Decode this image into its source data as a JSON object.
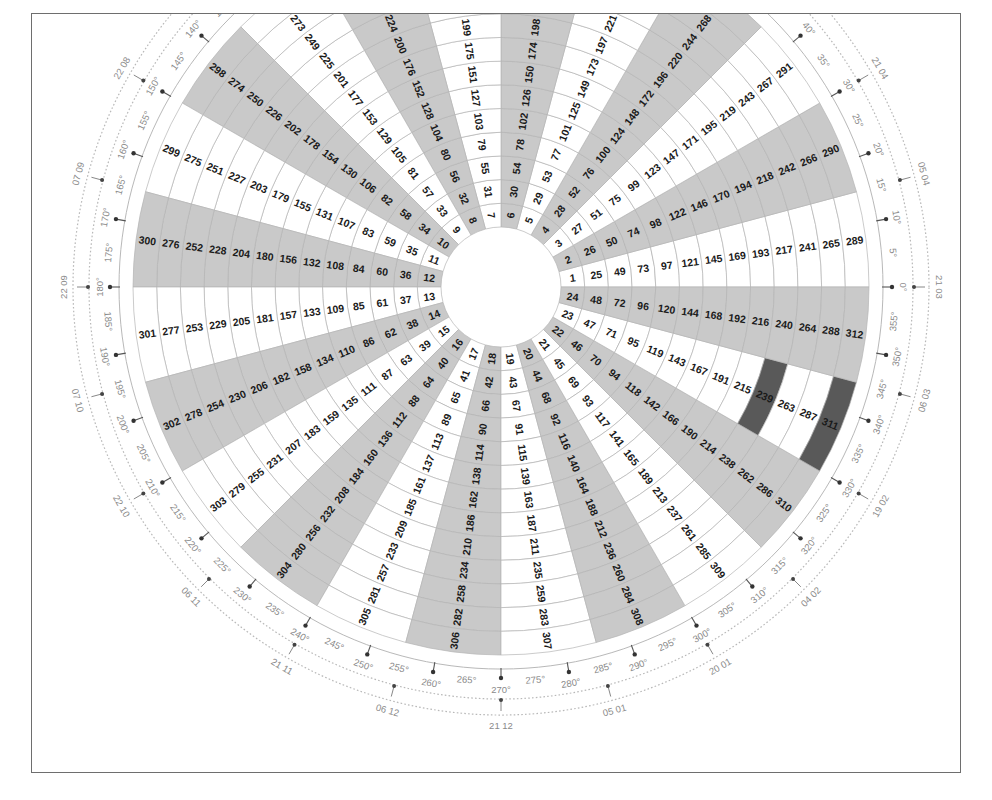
{
  "chart_data": {
    "type": "pie",
    "title": "",
    "subtitle": "",
    "xlabel": "",
    "ylabel": "",
    "sector_count": 24,
    "ring_count": 13,
    "cell_min": 1,
    "cell_max": 312,
    "cell_step_outward": 24,
    "angle_per_sector_deg": 15,
    "angle_start_deg": 0,
    "angle_direction": "counterclockwise",
    "center_px": [
      500,
      286
    ],
    "inner_radius_px": 60,
    "outer_radius_px": 368,
    "grid": true,
    "legend_position": "none",
    "colors": {
      "sector_shaded": "#c9c9c9",
      "sector_plain": "#ffffff",
      "highlight": "#595959",
      "cell_stroke": "#b4b4b4",
      "text": "#1a1a1a",
      "axis_text": "#8a8a8a",
      "axis_line": "#b0b0b0",
      "frame": "#6e6e6e"
    },
    "highlighted_cells": [
      239,
      311
    ],
    "sectors": [
      {
        "index": 0,
        "start_deg": 0,
        "end_deg": 15,
        "shaded": false,
        "base": 1,
        "values": [
          1,
          25,
          49,
          73,
          97,
          121,
          145,
          169,
          193,
          217,
          241,
          265,
          289
        ]
      },
      {
        "index": 1,
        "start_deg": 15,
        "end_deg": 30,
        "shaded": true,
        "base": 2,
        "values": [
          2,
          26,
          50,
          74,
          98,
          122,
          146,
          170,
          194,
          218,
          242,
          266,
          290
        ]
      },
      {
        "index": 2,
        "start_deg": 30,
        "end_deg": 45,
        "shaded": false,
        "base": 3,
        "values": [
          3,
          27,
          51,
          75,
          99,
          123,
          147,
          171,
          195,
          219,
          243,
          267,
          291
        ]
      },
      {
        "index": 3,
        "start_deg": 45,
        "end_deg": 60,
        "shaded": true,
        "base": 4,
        "values": [
          4,
          28,
          52,
          76,
          100,
          124,
          148,
          172,
          196,
          220,
          244,
          268,
          292
        ]
      },
      {
        "index": 4,
        "start_deg": 60,
        "end_deg": 75,
        "shaded": false,
        "base": 5,
        "values": [
          5,
          29,
          53,
          77,
          101,
          125,
          149,
          173,
          197,
          221,
          245,
          269,
          293
        ]
      },
      {
        "index": 5,
        "start_deg": 75,
        "end_deg": 90,
        "shaded": true,
        "base": 6,
        "values": [
          6,
          30,
          54,
          78,
          102,
          126,
          150,
          174,
          198,
          222,
          246,
          270,
          294
        ]
      },
      {
        "index": 6,
        "start_deg": 90,
        "end_deg": 105,
        "shaded": false,
        "base": 7,
        "values": [
          7,
          31,
          55,
          79,
          103,
          127,
          151,
          175,
          199,
          223,
          247,
          271,
          295
        ]
      },
      {
        "index": 7,
        "start_deg": 105,
        "end_deg": 120,
        "shaded": true,
        "base": 8,
        "values": [
          8,
          32,
          56,
          80,
          104,
          128,
          152,
          176,
          200,
          224,
          248,
          272,
          296
        ]
      },
      {
        "index": 8,
        "start_deg": 120,
        "end_deg": 135,
        "shaded": false,
        "base": 9,
        "values": [
          9,
          33,
          57,
          81,
          105,
          129,
          153,
          177,
          201,
          225,
          249,
          273,
          297
        ]
      },
      {
        "index": 9,
        "start_deg": 135,
        "end_deg": 150,
        "shaded": true,
        "base": 10,
        "values": [
          10,
          34,
          58,
          82,
          106,
          130,
          154,
          178,
          202,
          226,
          250,
          274,
          298
        ]
      },
      {
        "index": 10,
        "start_deg": 150,
        "end_deg": 165,
        "shaded": false,
        "base": 11,
        "values": [
          11,
          35,
          59,
          83,
          107,
          131,
          155,
          179,
          203,
          227,
          251,
          275,
          299
        ]
      },
      {
        "index": 11,
        "start_deg": 165,
        "end_deg": 180,
        "shaded": true,
        "base": 12,
        "values": [
          12,
          36,
          60,
          84,
          108,
          132,
          156,
          180,
          204,
          228,
          252,
          276,
          300
        ]
      },
      {
        "index": 12,
        "start_deg": 180,
        "end_deg": 195,
        "shaded": false,
        "base": 13,
        "values": [
          13,
          37,
          61,
          85,
          109,
          133,
          157,
          181,
          205,
          229,
          253,
          277,
          301
        ]
      },
      {
        "index": 13,
        "start_deg": 195,
        "end_deg": 210,
        "shaded": true,
        "base": 14,
        "values": [
          14,
          38,
          62,
          86,
          110,
          134,
          158,
          182,
          206,
          230,
          254,
          278,
          302
        ]
      },
      {
        "index": 14,
        "start_deg": 210,
        "end_deg": 225,
        "shaded": false,
        "base": 15,
        "values": [
          15,
          39,
          63,
          87,
          111,
          135,
          159,
          183,
          207,
          231,
          255,
          279,
          303
        ]
      },
      {
        "index": 15,
        "start_deg": 225,
        "end_deg": 240,
        "shaded": true,
        "base": 16,
        "values": [
          16,
          40,
          64,
          88,
          112,
          136,
          160,
          184,
          208,
          232,
          256,
          280,
          304
        ]
      },
      {
        "index": 16,
        "start_deg": 240,
        "end_deg": 255,
        "shaded": false,
        "base": 17,
        "values": [
          17,
          41,
          65,
          89,
          113,
          137,
          161,
          185,
          209,
          233,
          257,
          281,
          305
        ]
      },
      {
        "index": 17,
        "start_deg": 255,
        "end_deg": 270,
        "shaded": true,
        "base": 18,
        "values": [
          18,
          42,
          66,
          90,
          114,
          138,
          162,
          186,
          210,
          234,
          258,
          282,
          306
        ]
      },
      {
        "index": 18,
        "start_deg": 270,
        "end_deg": 285,
        "shaded": false,
        "base": 19,
        "values": [
          19,
          43,
          67,
          91,
          115,
          139,
          163,
          187,
          211,
          235,
          259,
          283,
          307
        ]
      },
      {
        "index": 19,
        "start_deg": 285,
        "end_deg": 300,
        "shaded": true,
        "base": 20,
        "values": [
          20,
          44,
          68,
          92,
          116,
          140,
          164,
          188,
          212,
          236,
          260,
          284,
          308
        ]
      },
      {
        "index": 20,
        "start_deg": 300,
        "end_deg": 315,
        "shaded": false,
        "base": 21,
        "values": [
          21,
          45,
          69,
          93,
          117,
          141,
          165,
          189,
          213,
          237,
          261,
          285,
          309
        ]
      },
      {
        "index": 21,
        "start_deg": 315,
        "end_deg": 330,
        "shaded": true,
        "base": 22,
        "values": [
          22,
          46,
          70,
          94,
          118,
          142,
          166,
          190,
          214,
          238,
          262,
          286,
          310
        ]
      },
      {
        "index": 22,
        "start_deg": 330,
        "end_deg": 345,
        "shaded": false,
        "base": 23,
        "values": [
          23,
          47,
          71,
          95,
          119,
          143,
          167,
          191,
          215,
          239,
          263,
          287,
          311
        ]
      },
      {
        "index": 23,
        "start_deg": 345,
        "end_deg": 360,
        "shaded": true,
        "base": 24,
        "values": [
          24,
          48,
          72,
          96,
          120,
          144,
          168,
          192,
          216,
          240,
          264,
          288,
          312
        ]
      }
    ],
    "degree_ticks": [
      "0°",
      "5°",
      "10°",
      "15°",
      "20°",
      "25°",
      "30°",
      "35°",
      "40°",
      "45°",
      "50°",
      "55°",
      "60°",
      "65°",
      "70°",
      "75°",
      "80°",
      "85°",
      "90°",
      "95°",
      "100°",
      "105°",
      "110°",
      "115°",
      "120°",
      "125°",
      "130°",
      "135°",
      "140°",
      "145°",
      "150°",
      "155°",
      "160°",
      "165°",
      "170°",
      "175°",
      "180°",
      "185°",
      "190°",
      "195°",
      "200°",
      "205°",
      "210°",
      "215°",
      "220°",
      "225°",
      "230°",
      "235°",
      "240°",
      "245°",
      "250°",
      "255°",
      "260°",
      "265°",
      "270°",
      "275°",
      "280°",
      "285°",
      "290°",
      "295°",
      "300°",
      "305°",
      "310°",
      "315°",
      "320°",
      "325°",
      "330°",
      "335°",
      "340°",
      "345°",
      "350°",
      "355°"
    ],
    "degree_tick_step": 5,
    "degree_marker_step": 10,
    "outer_annotations": [
      {
        "label": "21 03",
        "deg": 0
      },
      {
        "label": "05 04",
        "deg": 15
      },
      {
        "label": "21 04",
        "deg": 30
      },
      {
        "label": "22 08",
        "deg": 150
      },
      {
        "label": "07 09",
        "deg": 165
      },
      {
        "label": "22 09",
        "deg": 180
      },
      {
        "label": "07 10",
        "deg": 195
      },
      {
        "label": "22 10",
        "deg": 210
      },
      {
        "label": "06 11",
        "deg": 225
      },
      {
        "label": "21 11",
        "deg": 240
      },
      {
        "label": "06 12",
        "deg": 255
      },
      {
        "label": "21 12",
        "deg": 270
      },
      {
        "label": "05 01",
        "deg": 285
      },
      {
        "label": "20 01",
        "deg": 300
      },
      {
        "label": "04 02",
        "deg": 315
      },
      {
        "label": "19 02",
        "deg": 330
      },
      {
        "label": "06 03",
        "deg": 345
      }
    ],
    "axis_origin_markers": [
      "0°"
    ]
  }
}
